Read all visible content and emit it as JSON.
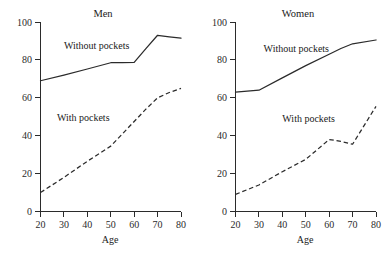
{
  "chart_data": [
    {
      "type": "line",
      "title": "Men",
      "xlabel": "Age",
      "ylabel": "",
      "xlim": [
        20,
        80
      ],
      "ylim": [
        0,
        100
      ],
      "xticks": [
        20,
        30,
        40,
        50,
        60,
        70,
        80
      ],
      "yticks": [
        0,
        20,
        40,
        60,
        80,
        100
      ],
      "grid": false,
      "legend": "inline-annotations",
      "x": [
        20,
        30,
        40,
        50,
        55,
        60,
        65,
        70,
        75,
        80
      ],
      "series": [
        {
          "name": "Without pockets",
          "style": "solid",
          "label_x": 30,
          "label_y": 86,
          "values": [
            69.0,
            72.0,
            75.2,
            78.5,
            78.6,
            78.7,
            86.0,
            93.0,
            92.2,
            91.5
          ]
        },
        {
          "name": "With pockets",
          "style": "dashed",
          "label_x": 27,
          "label_y": 48,
          "values": [
            10.0,
            18.0,
            26.5,
            34.5,
            41.0,
            47.5,
            54.0,
            60.0,
            62.8,
            65.0
          ]
        }
      ]
    },
    {
      "type": "line",
      "title": "Women",
      "xlabel": "Age",
      "ylabel": "",
      "xlim": [
        20,
        80
      ],
      "ylim": [
        0,
        100
      ],
      "xticks": [
        20,
        30,
        40,
        50,
        60,
        70,
        80
      ],
      "yticks": [
        0,
        20,
        40,
        60,
        80,
        100
      ],
      "grid": false,
      "legend": "inline-annotations",
      "x": [
        20,
        30,
        40,
        50,
        60,
        65,
        70,
        80
      ],
      "series": [
        {
          "name": "Without pockets",
          "style": "solid",
          "label_x": 32,
          "label_y": 84,
          "values": [
            63.0,
            64.0,
            70.5,
            77.0,
            83.0,
            86.0,
            88.5,
            90.5
          ]
        },
        {
          "name": "With pockets",
          "style": "dashed",
          "label_x": 40,
          "label_y": 47,
          "values": [
            9.0,
            14.0,
            21.0,
            27.5,
            38.0,
            37.0,
            35.5,
            55.5
          ]
        }
      ]
    }
  ],
  "panels": [
    {
      "id": "men",
      "title": "Men",
      "xlabel": "Age",
      "xticks": [
        "20",
        "30",
        "40",
        "50",
        "60",
        "70",
        "80"
      ],
      "yticks": [
        "0",
        "20",
        "40",
        "60",
        "80",
        "100"
      ],
      "series": [
        {
          "name": "Without pockets",
          "label": "Without pockets"
        },
        {
          "name": "With pockets",
          "label": "With pockets"
        }
      ]
    },
    {
      "id": "women",
      "title": "Women",
      "xlabel": "Age",
      "xticks": [
        "20",
        "30",
        "40",
        "50",
        "60",
        "70",
        "80"
      ],
      "yticks": [
        "0",
        "20",
        "40",
        "60",
        "80",
        "100"
      ],
      "series": [
        {
          "name": "Without pockets",
          "label": "Without pockets"
        },
        {
          "name": "With pockets",
          "label": "With pockets"
        }
      ]
    }
  ],
  "colors": {
    "line": "#2b2b2b",
    "text": "#1a1a1a",
    "background": "#ffffff"
  }
}
